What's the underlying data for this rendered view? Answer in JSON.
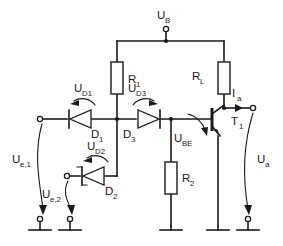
{
  "diagram": {
    "type": "electronic-schematic",
    "width": 283,
    "height": 246,
    "background_color": "#ffffff",
    "line_color": "#1a1a1a"
  },
  "labels": {
    "supply": {
      "main": "U",
      "sub": "B"
    },
    "r1": {
      "main": "R",
      "sub": "1"
    },
    "rl": {
      "main": "R",
      "sub": "L"
    },
    "r2": {
      "main": "R",
      "sub": "2"
    },
    "d1": {
      "main": "D",
      "sub": "1"
    },
    "d2": {
      "main": "D",
      "sub": "2"
    },
    "d3": {
      "main": "D",
      "sub": "3"
    },
    "t1": {
      "main": "T",
      "sub": "1"
    },
    "ud1": {
      "main": "U",
      "sub": "D1"
    },
    "ud2": {
      "main": "U",
      "sub": "D2"
    },
    "ud3": {
      "main": "U",
      "sub": "D3"
    },
    "ube": {
      "main": "U",
      "sub": "BE"
    },
    "ue1": {
      "main": "U",
      "sub": "e,1"
    },
    "ue2": {
      "main": "U",
      "sub": "e,2"
    },
    "ua": {
      "main": "U",
      "sub": "a"
    },
    "ia": {
      "main": "I",
      "sub": "a"
    }
  },
  "components": [
    {
      "id": "R1",
      "kind": "resistor",
      "label": "R1",
      "orientation": "vertical"
    },
    {
      "id": "RL",
      "kind": "resistor",
      "label": "RL",
      "orientation": "vertical"
    },
    {
      "id": "R2",
      "kind": "resistor",
      "label": "R2",
      "orientation": "vertical"
    },
    {
      "id": "D1",
      "kind": "diode",
      "label": "D1",
      "direction": "left"
    },
    {
      "id": "D2",
      "kind": "zener",
      "label": "D2",
      "direction": "left"
    },
    {
      "id": "D3",
      "kind": "diode",
      "label": "D3",
      "direction": "right"
    },
    {
      "id": "T1",
      "kind": "npn-transistor",
      "label": "T1"
    }
  ],
  "terminals": [
    {
      "id": "UB",
      "label": "U_B",
      "position": "top"
    },
    {
      "id": "Ue1",
      "label": "U_e,1",
      "position": "left"
    },
    {
      "id": "Ue2",
      "label": "U_e,2",
      "position": "left-lower"
    },
    {
      "id": "Ua",
      "label": "U_a",
      "position": "right"
    }
  ],
  "grounds": [
    {
      "id": "gnd-ue1",
      "style": "terminal"
    },
    {
      "id": "gnd-ue2",
      "style": "terminal"
    },
    {
      "id": "gnd-r2",
      "style": "plain"
    },
    {
      "id": "gnd-emitter",
      "style": "plain"
    },
    {
      "id": "gnd-ua",
      "style": "terminal"
    }
  ],
  "annotations": [
    {
      "id": "UD1",
      "label": "U_D1",
      "kind": "voltage-arc",
      "direction": "ccw"
    },
    {
      "id": "UD2",
      "label": "U_D2",
      "kind": "voltage-arc",
      "direction": "ccw"
    },
    {
      "id": "UD3",
      "label": "U_D3",
      "kind": "voltage-arc",
      "direction": "cw"
    },
    {
      "id": "UBE",
      "label": "U_BE",
      "kind": "voltage-arc",
      "direction": "cw"
    },
    {
      "id": "Ia",
      "label": "I_a",
      "kind": "current-arrow",
      "direction": "right"
    }
  ]
}
